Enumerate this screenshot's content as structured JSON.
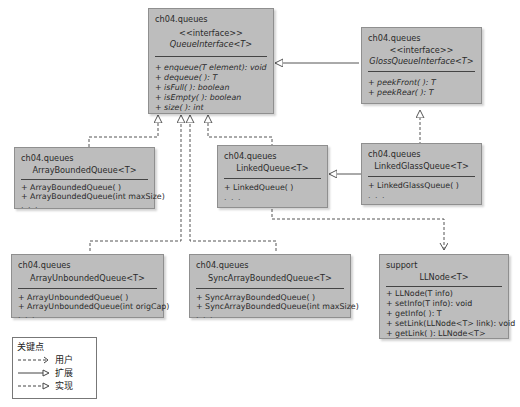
{
  "diagram": {
    "type": "UML class diagram",
    "classes": [
      {
        "id": "queue_interface",
        "package": "ch04.queues",
        "stereotype": "<<interface>>",
        "name": "QueueInterface<T>",
        "italic": true,
        "operations": [
          "+ enqueue(T element): void",
          "+ dequeue( ): T",
          "+ isFull( ): boolean",
          "+ isEmpty( ): boolean",
          "+ size( ): int"
        ]
      },
      {
        "id": "gloss_queue_interface",
        "package": "ch04.queues",
        "stereotype": "<<interface>>",
        "name": "GlossQueueInterface<T>",
        "italic": true,
        "operations": [
          "+ peekFront( ): T",
          "+ peekRear( ): T"
        ]
      },
      {
        "id": "array_bounded_queue",
        "package": "ch04.queues",
        "name": "ArrayBoundedQueue<T>",
        "operations": [
          "+ ArrayBoundedQueue( )",
          "+ ArrayBoundedQueue(int maxSize)",
          ". . ."
        ]
      },
      {
        "id": "linked_queue",
        "package": "ch04.queues",
        "name": "LinkedQueue<T>",
        "operations": [
          "+ LinkedQueue( )",
          ". . ."
        ]
      },
      {
        "id": "linked_gloss_queue",
        "package": "ch04.queues",
        "name": "LinkedGlassQueue<T>",
        "operations": [
          "+ LinkedGlassQueue( )",
          ". . ."
        ]
      },
      {
        "id": "array_unbounded_queue",
        "package": "ch04.queues",
        "name": "ArrayUnboundedQueue<T>",
        "operations": [
          "+ ArrayUnboundedQueue( )",
          "+ ArrayUnboundedQueue(int origCap)",
          ". . ."
        ]
      },
      {
        "id": "sync_array_bounded_queue",
        "package": "ch04.queues",
        "name": "SyncArrayBoundedQueue<T>",
        "operations": [
          "+ SyncArrayBoundedQueue( )",
          "+ SyncArrayBoundedQueue(int maxSize)",
          ". . ."
        ]
      },
      {
        "id": "ll_node",
        "package": "support",
        "name": "LLNode<T>",
        "operations": [
          "+ LLNode(T info)",
          "+ setInfo(T info): void",
          "+ getInfo( ): T",
          "+ setLink(LLNode<T> link): void",
          "+ getLink( ): LLNode<T>"
        ]
      }
    ],
    "relations": [
      {
        "from": "gloss_queue_interface",
        "to": "queue_interface",
        "kind": "extends"
      },
      {
        "from": "array_bounded_queue",
        "to": "queue_interface",
        "kind": "implements"
      },
      {
        "from": "array_unbounded_queue",
        "to": "queue_interface",
        "kind": "implements"
      },
      {
        "from": "sync_array_bounded_queue",
        "to": "queue_interface",
        "kind": "implements"
      },
      {
        "from": "linked_queue",
        "to": "queue_interface",
        "kind": "implements"
      },
      {
        "from": "linked_gloss_queue",
        "to": "gloss_queue_interface",
        "kind": "implements"
      },
      {
        "from": "linked_gloss_queue",
        "to": "linked_queue",
        "kind": "extends"
      },
      {
        "from": "linked_queue",
        "to": "ll_node",
        "kind": "uses"
      }
    ]
  },
  "legend": {
    "title": "关键点",
    "items": [
      {
        "style": "dashed-open-arrow",
        "label": "用户"
      },
      {
        "style": "solid-triangle",
        "label": "扩展"
      },
      {
        "style": "dashed-triangle",
        "label": "实现"
      }
    ]
  },
  "colors": {
    "box_fill": "#bdbdbd",
    "box_border": "#8f8f8f",
    "line": "#555555"
  }
}
